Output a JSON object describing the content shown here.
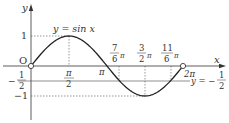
{
  "chart_data": {
    "type": "line",
    "title": "",
    "function_label": "y = sin x",
    "xlabel": "x",
    "ylabel": "y",
    "origin_label": "O",
    "x_ticks": [
      {
        "value": "pi/2",
        "num": "π",
        "den": "2"
      },
      {
        "value": "pi",
        "label": "π"
      },
      {
        "value": "7pi/6",
        "num": "7",
        "den": "6",
        "suffix": "π"
      },
      {
        "value": "3pi/2",
        "num": "3",
        "den": "2",
        "suffix": "π"
      },
      {
        "value": "11pi/6",
        "num": "11",
        "den": "6",
        "suffix": "π"
      },
      {
        "value": "2pi",
        "label": "2π"
      }
    ],
    "y_ticks": [
      {
        "value": 1,
        "label": "1"
      },
      {
        "value": -0.5,
        "label": "-1/2"
      },
      {
        "value": -1,
        "label": "-1"
      }
    ],
    "horizontal_line": {
      "y": -0.5,
      "label": "y = -1/2"
    },
    "series": [
      {
        "name": "y = sin x",
        "x_range": [
          0,
          6.2832
        ],
        "samples": [
          [
            0,
            0
          ],
          [
            0.5236,
            0.5
          ],
          [
            1.5708,
            1
          ],
          [
            3.1416,
            0
          ],
          [
            3.6652,
            -0.5
          ],
          [
            4.7124,
            -1
          ],
          [
            5.7596,
            -0.5
          ],
          [
            6.2832,
            0
          ]
        ]
      }
    ],
    "open_endpoints": [
      [
        0,
        0
      ],
      [
        6.2832,
        0
      ]
    ],
    "xlim": [
      -0.5,
      7.2
    ],
    "ylim": [
      -1.5,
      1.6
    ],
    "grid": false,
    "legend": "none"
  },
  "labels": {
    "y_axis": "y",
    "x_axis": "x",
    "origin": "O",
    "func": "y = sin x",
    "one": "1",
    "neg_one": "−1",
    "neg_half_sign": "−",
    "half_num": "1",
    "half_den": "2",
    "pi_half_num": "π",
    "pi_half_den": "2",
    "pi": "π",
    "seven_num": "7",
    "seven_den": "6",
    "three_num": "3",
    "three_den": "2",
    "eleven_num": "11",
    "eleven_den": "6",
    "pi_suffix": "π",
    "two_pi": "2π",
    "line_eq": "y = −",
    "line_num": "1",
    "line_den": "2"
  }
}
